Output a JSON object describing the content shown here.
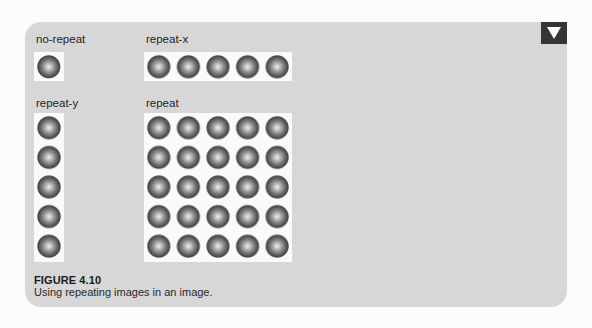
{
  "figure": {
    "examples": [
      {
        "label": "no-repeat",
        "repeat": "no-repeat",
        "columns": 1,
        "rows": 1
      },
      {
        "label": "repeat-x",
        "repeat": "repeat-x",
        "columns": 5,
        "rows": 1
      },
      {
        "label": "repeat-y",
        "repeat": "repeat-y",
        "columns": 1,
        "rows": 5
      },
      {
        "label": "repeat",
        "repeat": "repeat",
        "columns": 5,
        "rows": 5
      }
    ],
    "tile_icon": "shaded-sphere-icon",
    "corner_tab_icon": "triangle-down-icon",
    "caption": {
      "title": "FIGURE 4.10",
      "text": "Using repeating images in an image."
    },
    "colors": {
      "panel_background": "#d7d7d7",
      "tab_background": "#353535",
      "box_background": "#fafafa",
      "sphere_dark": "#444444",
      "sphere_highlight": "#f2f2f2"
    }
  }
}
